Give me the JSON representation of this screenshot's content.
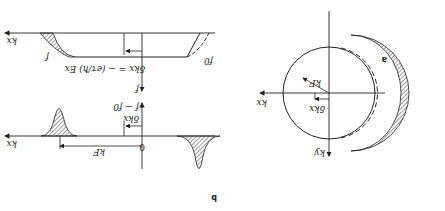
{
  "figure": {
    "orientation": "rotated 180 degrees",
    "panel_a": {
      "label": "a",
      "axis_x": "kx",
      "axis_y": "ky",
      "radius_label": "kF",
      "shift_label": "δkx"
    },
    "panel_b": {
      "label": "b",
      "top_plot": {
        "axis_x": "kx",
        "axis_y": "f − f0",
        "fermi_label": "kF",
        "origin_label": "0",
        "shift_label": "δkx"
      },
      "bottom_plot": {
        "axis_x": "kx",
        "axis_y": "f",
        "shift_label": "δkx = − (eτ/ħ) Ex",
        "curve_label_left": "f",
        "curve_label_right": "f0"
      }
    }
  },
  "colors": {
    "ink": "#222222",
    "hatch": "#555555",
    "background": "#ffffff"
  }
}
